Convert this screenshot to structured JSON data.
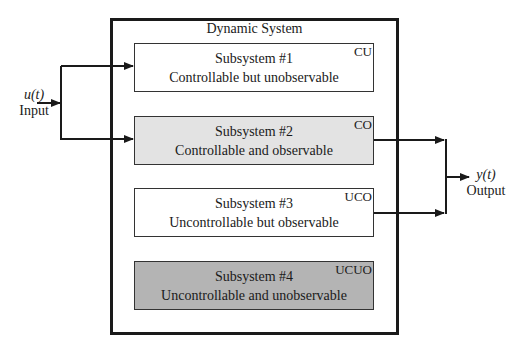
{
  "diagram": {
    "title": "Dynamic System",
    "input": {
      "symbol": "u(t)",
      "label": "Input"
    },
    "output": {
      "symbol": "y(t)",
      "label": "Output"
    },
    "subsystems": [
      {
        "name": "Subsystem #1",
        "description": "Controllable but unobservable",
        "tag": "CU",
        "fill": "#ffffff",
        "connected_input": true,
        "connected_output": false
      },
      {
        "name": "Subsystem #2",
        "description": "Controllable and observable",
        "tag": "CO",
        "fill": "#e3e3e3",
        "connected_input": true,
        "connected_output": true
      },
      {
        "name": "Subsystem #3",
        "description": "Uncontrollable but observable",
        "tag": "UCO",
        "fill": "#ffffff",
        "connected_input": false,
        "connected_output": true
      },
      {
        "name": "Subsystem #4",
        "description": "Uncontrollable and unobservable",
        "tag": "UCUO",
        "fill": "#b4b4b4",
        "connected_input": false,
        "connected_output": false
      }
    ]
  }
}
